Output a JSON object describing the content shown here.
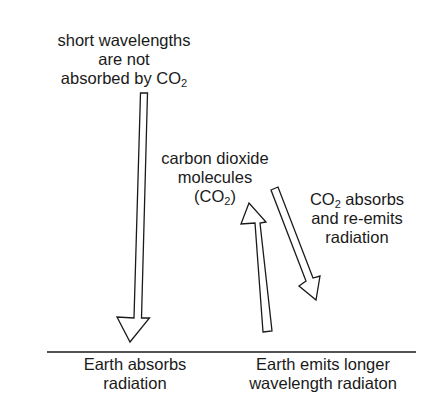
{
  "diagram": {
    "labels": {
      "short_wavelengths": {
        "line1": "short wavelengths",
        "line2": "are not",
        "line3_prefix": "absorbed by CO",
        "line3_sub": "2"
      },
      "co2_molecules": {
        "line1": "carbon dioxide",
        "line2": "molecules",
        "line3_prefix": "(CO",
        "line3_sub": "2",
        "line3_suffix": ")"
      },
      "co2_absorbs": {
        "line1_prefix": "CO",
        "line1_sub": "2",
        "line1_suffix": " absorbs",
        "line2": "and re-emits",
        "line3": "radiation"
      },
      "earth_absorbs": {
        "line1": "Earth absorbs",
        "line2": "radiation"
      },
      "earth_emits": {
        "line1": "Earth emits longer",
        "line2": "wavelength radiaton"
      }
    },
    "arrows": [
      {
        "name": "incoming-short-wavelength",
        "direction": "down"
      },
      {
        "name": "earth-emitted-longwave",
        "direction": "up"
      },
      {
        "name": "co2-reemitted",
        "direction": "down"
      }
    ],
    "colors": {
      "stroke": "#1a1a1a",
      "fill": "#ffffff",
      "text": "#1a1a1a"
    }
  }
}
